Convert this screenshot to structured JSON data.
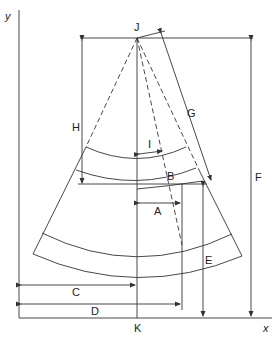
{
  "diagram": {
    "axes": {
      "x_label": "x",
      "y_label": "y"
    },
    "points": {
      "apex": "J",
      "base": "K"
    },
    "dimensions": {
      "A": "A",
      "B": "B",
      "C": "C",
      "D": "D",
      "E": "E",
      "F": "F",
      "G": "G",
      "H": "H",
      "I": "I"
    },
    "colors": {
      "line": "#333333",
      "background": "#ffffff"
    }
  }
}
